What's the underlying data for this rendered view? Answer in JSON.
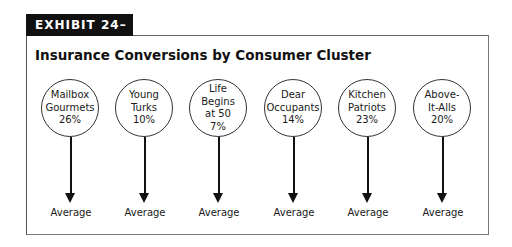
{
  "exhibit": {
    "label": "EXHIBIT 24–7"
  },
  "title": "Insurance Conversions by Consumer Cluster",
  "clusters": [
    {
      "line1": "Mailbox",
      "line2": "Gourmets",
      "line3": "",
      "pct": "26%",
      "target": "Average"
    },
    {
      "line1": "Young",
      "line2": "Turks",
      "line3": "",
      "pct": "10%",
      "target": "Average"
    },
    {
      "line1": "Life",
      "line2": "Begins",
      "line3": "at 50",
      "pct": "7%",
      "target": "Average"
    },
    {
      "line1": "Dear",
      "line2": "Occupants",
      "line3": "",
      "pct": "14%",
      "target": "Average"
    },
    {
      "line1": "Kitchen",
      "line2": "Patriots",
      "line3": "",
      "pct": "23%",
      "target": "Average"
    },
    {
      "line1": "Above-",
      "line2": "It-Alls",
      "line3": "",
      "pct": "20%",
      "target": "Average"
    }
  ]
}
